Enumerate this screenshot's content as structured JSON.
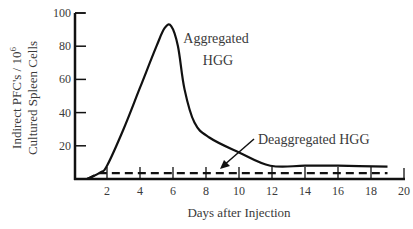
{
  "chart_data": {
    "type": "line",
    "title": "",
    "xlabel": "Days after Injection",
    "ylabel_line1": "Indirect PFC's / 10",
    "ylabel_sup": "6",
    "ylabel_line2": "Cultured Spleen Cells",
    "xlim": [
      0,
      20
    ],
    "ylim": [
      0,
      100
    ],
    "x_ticks": [
      2,
      4,
      6,
      8,
      10,
      12,
      14,
      16,
      18,
      20
    ],
    "y_ticks": [
      20,
      40,
      60,
      80,
      100
    ],
    "grid": false,
    "legend": "inline annotations",
    "series": [
      {
        "name": "Aggregated HGG",
        "style": "solid",
        "label_line1": "Aggregated",
        "label_line2": "HGG",
        "x": [
          0.8,
          1.6,
          2,
          3,
          4,
          5,
          5.5,
          5.9,
          6.3,
          6.7,
          7.3,
          8.2,
          10,
          11.9,
          14,
          16,
          19
        ],
        "y": [
          0,
          4,
          8,
          30,
          55,
          80,
          91,
          92,
          80,
          54,
          34,
          25,
          16,
          8,
          8,
          8,
          7.5
        ]
      },
      {
        "name": "Deaggregated HGG",
        "style": "dashed",
        "label": "Deaggregated HGG",
        "x": [
          0.8,
          1.5,
          19
        ],
        "y": [
          0,
          3.5,
          3.5
        ]
      }
    ]
  }
}
